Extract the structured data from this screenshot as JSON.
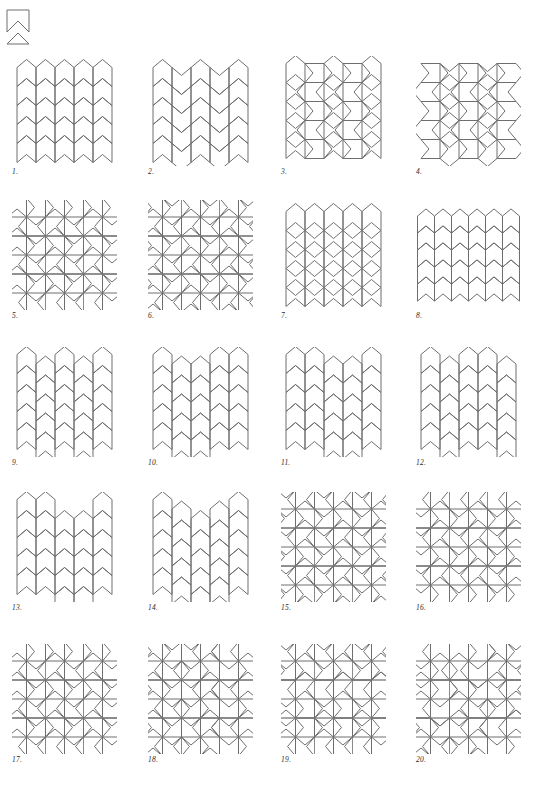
{
  "page": {
    "background_color": "#ffffff",
    "line_color": "#6e6e6e",
    "block_line_color": "#8a8a8a",
    "width": 533,
    "height": 796
  },
  "legend": {
    "name": "prototile",
    "label": "",
    "shape": "notched-square-chevron",
    "size": 28
  },
  "figures": [
    {
      "n": 1,
      "caption": "1.",
      "type": "chevron-columns",
      "cols": 5,
      "rows": 5,
      "cell": 19,
      "flip": 0,
      "phase": [
        0,
        0,
        0,
        0,
        0
      ]
    },
    {
      "n": 2,
      "caption": "2.",
      "type": "chevron-columns",
      "cols": 5,
      "rows": 5,
      "cell": 19,
      "flip": 1,
      "phase": [
        0,
        0,
        0,
        0,
        0
      ]
    },
    {
      "n": 3,
      "caption": "3.",
      "type": "pinwheel-field",
      "cols": 3,
      "rows": 3,
      "cell": 19,
      "variant": "a"
    },
    {
      "n": 4,
      "caption": "4.",
      "type": "pinwheel-field",
      "cols": 3,
      "rows": 3,
      "cell": 19,
      "variant": "b"
    },
    {
      "n": 5,
      "caption": "5.",
      "type": "pinwheel-blocks",
      "cols": 3,
      "rows": 3,
      "cell": 19,
      "variant": "a"
    },
    {
      "n": 6,
      "caption": "6.",
      "type": "pinwheel-blocks",
      "cols": 3,
      "rows": 3,
      "cell": 19,
      "variant": "b"
    },
    {
      "n": 7,
      "caption": "7.",
      "type": "chevron-columns",
      "cols": 5,
      "rows": 5,
      "cell": 19,
      "flip": 2,
      "phase": [
        0,
        0,
        0,
        0,
        0
      ]
    },
    {
      "n": 8,
      "caption": "8.",
      "type": "chevron-columns",
      "cols": 6,
      "rows": 5,
      "cell": 17,
      "flip": 3,
      "phase": [
        0,
        0,
        0,
        0,
        0,
        0
      ]
    },
    {
      "n": 9,
      "caption": "9.",
      "type": "offset-columns",
      "cols": 5,
      "rows": 5,
      "cell": 19,
      "phase": [
        0,
        1,
        0,
        1,
        0
      ]
    },
    {
      "n": 10,
      "caption": "10.",
      "type": "offset-columns",
      "cols": 5,
      "rows": 5,
      "cell": 19,
      "phase": [
        0,
        1,
        1,
        0,
        0
      ]
    },
    {
      "n": 11,
      "caption": "11.",
      "type": "offset-columns",
      "cols": 5,
      "rows": 5,
      "cell": 19,
      "phase": [
        0,
        0,
        1,
        1,
        0
      ]
    },
    {
      "n": 12,
      "caption": "12.",
      "type": "offset-columns",
      "cols": 5,
      "rows": 5,
      "cell": 19,
      "phase": [
        0,
        1,
        0,
        0,
        1
      ]
    },
    {
      "n": 13,
      "caption": "13.",
      "type": "offset-columns",
      "cols": 5,
      "rows": 5,
      "cell": 19,
      "phase": [
        0,
        0,
        2,
        2,
        0
      ]
    },
    {
      "n": 14,
      "caption": "14.",
      "type": "offset-columns",
      "cols": 5,
      "rows": 5,
      "cell": 19,
      "phase": [
        0,
        1,
        2,
        1,
        0
      ]
    },
    {
      "n": 15,
      "caption": "15.",
      "type": "pinwheel-blocks",
      "cols": 3,
      "rows": 3,
      "cell": 19,
      "variant": "c"
    },
    {
      "n": 16,
      "caption": "16.",
      "type": "pinwheel-blocks",
      "cols": 3,
      "rows": 3,
      "cell": 19,
      "variant": "d"
    },
    {
      "n": 17,
      "caption": "17.",
      "type": "pinwheel-blocks",
      "cols": 3,
      "rows": 3,
      "cell": 19,
      "variant": "a"
    },
    {
      "n": 18,
      "caption": "18.",
      "type": "pinwheel-blocks",
      "cols": 3,
      "rows": 3,
      "cell": 19,
      "variant": "e"
    },
    {
      "n": 19,
      "caption": "19.",
      "type": "pinwheel-blocks",
      "cols": 3,
      "rows": 3,
      "cell": 19,
      "variant": "f"
    },
    {
      "n": 20,
      "caption": "20.",
      "type": "pinwheel-blocks",
      "cols": 3,
      "rows": 3,
      "cell": 19,
      "variant": "g"
    }
  ],
  "layout": {
    "columns": 4,
    "rows": 5,
    "col_x": [
      12,
      148,
      281,
      416
    ],
    "row_y": [
      4,
      148,
      295,
      440,
      592
    ],
    "caption_dy": 112,
    "panel_w": 105,
    "panel_h": 110
  }
}
